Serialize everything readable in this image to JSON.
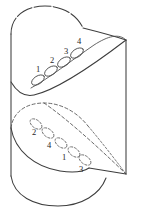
{
  "figure": {
    "background_color": "#ffffff",
    "stroke_color": "#3d3d3d",
    "dashed_stroke_color": "#4f4f4f",
    "label_color": "#262626",
    "width": 142,
    "height": 210
  },
  "labels": {
    "upper_chain": [
      {
        "id": "upper-label-1",
        "text": "1",
        "x": 38,
        "y": 70
      },
      {
        "id": "upper-label-2",
        "text": "2",
        "x": 52,
        "y": 61
      },
      {
        "id": "upper-label-3",
        "text": "3",
        "x": 66,
        "y": 52
      },
      {
        "id": "upper-label-4",
        "text": "4",
        "x": 79,
        "y": 42
      }
    ],
    "lower_chain": [
      {
        "id": "lower-label-2",
        "text": "2",
        "x": 34,
        "y": 133
      },
      {
        "id": "lower-label-4",
        "text": "4",
        "x": 49,
        "y": 146
      },
      {
        "id": "lower-label-1",
        "text": "1",
        "x": 64,
        "y": 158
      },
      {
        "id": "lower-label-3",
        "text": "3",
        "x": 81,
        "y": 170
      }
    ]
  },
  "upper_chain_ovals": [
    {
      "id": "upper-oval-1",
      "cx": 38,
      "cy": 80,
      "rx": 7.2,
      "ry": 4.0,
      "rotation": -33
    },
    {
      "id": "upper-oval-2",
      "cx": 51,
      "cy": 71,
      "rx": 7.2,
      "ry": 4.0,
      "rotation": -33
    },
    {
      "id": "upper-oval-3",
      "cx": 64,
      "cy": 62,
      "rx": 7.2,
      "ry": 4.0,
      "rotation": -33
    },
    {
      "id": "upper-oval-4",
      "cx": 77,
      "cy": 53,
      "rx": 7.2,
      "ry": 4.0,
      "rotation": -33
    }
  ],
  "lower_chain_ovals": [
    {
      "id": "lower-oval-1",
      "cx": 36,
      "cy": 124,
      "rx": 6.8,
      "ry": 4.0,
      "rotation": 37
    },
    {
      "id": "lower-oval-2",
      "cx": 48,
      "cy": 133,
      "rx": 6.8,
      "ry": 4.0,
      "rotation": 37
    },
    {
      "id": "lower-oval-3",
      "cx": 61,
      "cy": 143,
      "rx": 6.8,
      "ry": 4.0,
      "rotation": 37
    },
    {
      "id": "lower-oval-4",
      "cx": 74,
      "cy": 152,
      "rx": 6.8,
      "ry": 4.0,
      "rotation": 37
    },
    {
      "id": "lower-oval-5",
      "cx": 85,
      "cy": 160,
      "rx": 6.8,
      "ry": 4.0,
      "rotation": 37
    }
  ],
  "curves": {
    "cylinder_left_edge": "M 11,34 L 11,176",
    "cylinder_right_edge": "M 126,40 L 126,174",
    "cylinder_bottom_arc": "M 11,176 C 14,196 34,206 58,206 C 82,206 100,194 106,178",
    "upper_dome_arc": "M 11,34 C 11,16 26,6 45,6 C 62,6 76,14 82,27",
    "saddle_front_curve": "M 11,82 C 20,92 30,95 40,92 C 62,85 96,64 126,40",
    "saddle_back_curve": "M 82,27 C 96,30 112,34 126,40",
    "upper_ridge_curve": "M 30,88 C 46,80 70,62 92,45 C 106,35 118,32 126,40",
    "lower_dashed_dome": "M 11,128 C 13,112 26,104 44,104 C 62,104 78,113 88,126",
    "lower_dashed_sweep": "M 44,104 C 64,116 94,142 126,174",
    "lower_solid_sweep": "M 88,168 C 100,170 114,172 126,174",
    "lower_front_curve": "M 11,128 C 16,150 36,166 60,170 C 72,172 82,171 88,168"
  }
}
